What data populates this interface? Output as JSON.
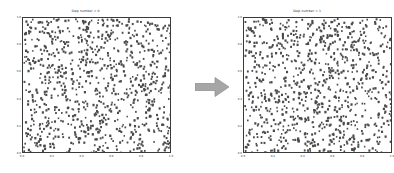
{
  "figure": {
    "background_color": "#ffffff",
    "point_color": "#4a4a4a",
    "frame_color": "#3a3a3a",
    "arrow_color": "#a6a6a6"
  },
  "panels": [
    {
      "id": "left",
      "title": "Step number = 0",
      "xticks": [
        "0.0",
        "0.2",
        "0.4",
        "0.6",
        "0.8",
        "1.0"
      ],
      "yticks": [
        "1.0",
        "0.8",
        "0.6",
        "0.4",
        "0.2",
        "0.0"
      ]
    },
    {
      "id": "right",
      "title": "Step number = 1",
      "xticks": [
        "0.0",
        "0.2",
        "0.4",
        "0.6",
        "0.8",
        "1.0"
      ],
      "yticks": [
        "1.0",
        "0.8",
        "0.6",
        "0.4",
        "0.2",
        "0.0"
      ]
    }
  ],
  "arrow": {
    "label": "transition-arrow",
    "direction": "right",
    "color": "#a6a6a6"
  },
  "chart_data": {
    "type": "scatter",
    "xlabel": "",
    "ylabel": "",
    "xlim": [
      0.0,
      1.0
    ],
    "ylim": [
      0.0,
      1.0
    ],
    "grid": false,
    "legend": "none",
    "marker": "point",
    "marker_color": "#4a4a4a",
    "marker_size": 1.4,
    "n_points": 900,
    "series": [
      {
        "name": "Step number = 0",
        "panel": "left",
        "description": "900 randomly/uniformly distributed particles in the unit square",
        "distribution": "uniform",
        "seed": 7
      },
      {
        "name": "Step number = 1",
        "panel": "right",
        "description": "Same 900 particles after one random-walk step; distribution remains uniform",
        "distribution": "uniform",
        "seed": 23
      }
    ]
  }
}
